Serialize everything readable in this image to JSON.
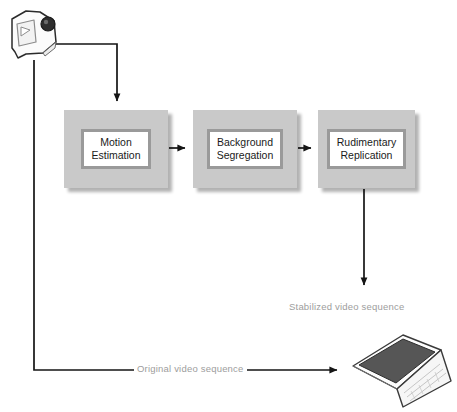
{
  "diagram": {
    "background_color": "#ffffff",
    "box_fill_color": "#c9c9c9",
    "box_inner_border_color": "#9a9a9a",
    "label_text_color": "#9d9d9d",
    "line_color": "#1a1a1a",
    "stages": [
      {
        "id": "motion-estimation",
        "line1": "Motion",
        "line2": "Estimation",
        "x": 64,
        "y": 110,
        "width": 104,
        "height": 78
      },
      {
        "id": "background-segregation",
        "line1": "Background",
        "line2": "Segregation",
        "x": 193,
        "y": 110,
        "width": 104,
        "height": 78
      },
      {
        "id": "rudimentary-replication",
        "line1": "Rudimentary",
        "line2": "Replication",
        "x": 318,
        "y": 110,
        "width": 97,
        "height": 78
      }
    ],
    "edge_labels": [
      {
        "id": "stabilized-video-sequence",
        "text": "Stabilized video sequence",
        "x": 289,
        "y": 301
      },
      {
        "id": "original-video-sequence",
        "text": "Original video sequence",
        "x": 134,
        "y": 363
      }
    ],
    "devices": [
      {
        "id": "camcorder",
        "name": "camcorder-icon",
        "x": 6,
        "y": 8,
        "width": 58,
        "height": 56
      },
      {
        "id": "laptop",
        "name": "laptop-icon",
        "x": 341,
        "y": 333,
        "width": 112,
        "height": 76
      }
    ]
  }
}
